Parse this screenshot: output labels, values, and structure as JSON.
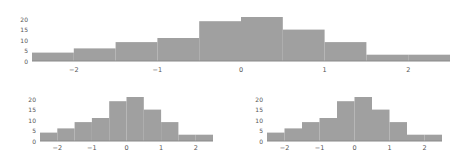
{
  "chart_data": [
    {
      "type": "bar",
      "title": "",
      "xlabel": "",
      "ylabel": "",
      "bin_edges": [
        -2.5,
        -2.0,
        -1.5,
        -1.0,
        -0.5,
        0.0,
        0.5,
        1.0,
        1.5,
        2.0,
        2.5
      ],
      "values": [
        4,
        6,
        9,
        11,
        19,
        21,
        15,
        9,
        3,
        3
      ],
      "xticks": [
        "−2",
        "−1",
        "0",
        "1",
        "2"
      ],
      "xtick_values": [
        -2,
        -1,
        0,
        1,
        2
      ],
      "yticks": [
        "0",
        "5",
        "10",
        "15",
        "20"
      ],
      "ytick_values": [
        0,
        5,
        10,
        15,
        20
      ],
      "xlim": [
        -2.5,
        2.5
      ],
      "ylim": [
        0,
        21
      ],
      "grid": false,
      "color": "#a0a0a0"
    },
    {
      "type": "bar",
      "title": "",
      "xlabel": "",
      "ylabel": "",
      "bin_edges": [
        -2.5,
        -2.0,
        -1.5,
        -1.0,
        -0.5,
        0.0,
        0.5,
        1.0,
        1.5,
        2.0,
        2.5
      ],
      "values": [
        4,
        6,
        9,
        11,
        19,
        21,
        15,
        9,
        3,
        3
      ],
      "xticks": [
        "−2",
        "−1",
        "0",
        "1",
        "2"
      ],
      "xtick_values": [
        -2,
        -1,
        0,
        1,
        2
      ],
      "yticks": [
        "0",
        "5",
        "10",
        "15",
        "20"
      ],
      "ytick_values": [
        0,
        5,
        10,
        15,
        20
      ],
      "xlim": [
        -2.5,
        2.5
      ],
      "ylim": [
        0,
        21
      ],
      "grid": false,
      "color": "#a0a0a0"
    },
    {
      "type": "bar",
      "title": "",
      "xlabel": "",
      "ylabel": "",
      "bin_edges": [
        -2.5,
        -2.0,
        -1.5,
        -1.0,
        -0.5,
        0.0,
        0.5,
        1.0,
        1.5,
        2.0,
        2.5
      ],
      "values": [
        4,
        6,
        9,
        11,
        19,
        21,
        15,
        9,
        3,
        3
      ],
      "xticks": [
        "−2",
        "−1",
        "0",
        "1",
        "2"
      ],
      "xtick_values": [
        -2,
        -1,
        0,
        1,
        2
      ],
      "yticks": [
        "0",
        "5",
        "10",
        "15",
        "20"
      ],
      "ytick_values": [
        0,
        5,
        10,
        15,
        20
      ],
      "xlim": [
        -2.5,
        2.5
      ],
      "ylim": [
        0,
        21
      ],
      "grid": false,
      "color": "#a0a0a0"
    }
  ],
  "layout": {
    "panels": [
      {
        "name": "histogram-top",
        "left": 32,
        "right": 450,
        "top": 17,
        "baseline": 61,
        "ytick_x": 28,
        "xtick_y": 72
      },
      {
        "name": "histogram-bottom-left",
        "left": 40,
        "right": 213,
        "top": 97,
        "baseline": 141,
        "ytick_x": 36,
        "xtick_y": 150
      },
      {
        "name": "histogram-bottom-right",
        "left": 267,
        "right": 442,
        "top": 97,
        "baseline": 141,
        "ytick_x": 263,
        "xtick_y": 150
      }
    ]
  }
}
